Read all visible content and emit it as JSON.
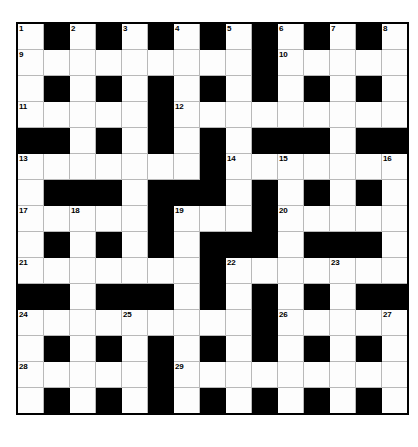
{
  "puzzle": {
    "type": "crossword-grid",
    "title": "",
    "rows": 15,
    "columns": 15,
    "cell_size_px": 25,
    "colors": {
      "block": "#000000",
      "cell": "#fdfdfd",
      "grid_line": "#b9b9b9",
      "border": "#000000",
      "number_text": "#000000",
      "page_background": "#ffffff"
    },
    "numbers_present": [
      1,
      2,
      3,
      4,
      5,
      6,
      7,
      8,
      9,
      10,
      11,
      12,
      13,
      14,
      15,
      16,
      17,
      18,
      19,
      20,
      21,
      22,
      23,
      24,
      25,
      26,
      27,
      28,
      29
    ],
    "grid": [
      [
        {
          "block": false,
          "number": "1"
        },
        {
          "block": true,
          "number": ""
        },
        {
          "block": false,
          "number": "2"
        },
        {
          "block": true,
          "number": ""
        },
        {
          "block": false,
          "number": "3"
        },
        {
          "block": true,
          "number": ""
        },
        {
          "block": false,
          "number": "4"
        },
        {
          "block": true,
          "number": ""
        },
        {
          "block": false,
          "number": "5"
        },
        {
          "block": true,
          "number": ""
        },
        {
          "block": false,
          "number": "6"
        },
        {
          "block": true,
          "number": ""
        },
        {
          "block": false,
          "number": "7"
        },
        {
          "block": true,
          "number": ""
        },
        {
          "block": false,
          "number": "8"
        }
      ],
      [
        {
          "block": false,
          "number": "9"
        },
        {
          "block": false,
          "number": ""
        },
        {
          "block": false,
          "number": ""
        },
        {
          "block": false,
          "number": ""
        },
        {
          "block": false,
          "number": ""
        },
        {
          "block": false,
          "number": ""
        },
        {
          "block": false,
          "number": ""
        },
        {
          "block": false,
          "number": ""
        },
        {
          "block": false,
          "number": ""
        },
        {
          "block": true,
          "number": ""
        },
        {
          "block": false,
          "number": "10"
        },
        {
          "block": false,
          "number": ""
        },
        {
          "block": false,
          "number": ""
        },
        {
          "block": false,
          "number": ""
        },
        {
          "block": false,
          "number": ""
        }
      ],
      [
        {
          "block": false,
          "number": ""
        },
        {
          "block": true,
          "number": ""
        },
        {
          "block": false,
          "number": ""
        },
        {
          "block": true,
          "number": ""
        },
        {
          "block": false,
          "number": ""
        },
        {
          "block": true,
          "number": ""
        },
        {
          "block": false,
          "number": ""
        },
        {
          "block": true,
          "number": ""
        },
        {
          "block": false,
          "number": ""
        },
        {
          "block": true,
          "number": ""
        },
        {
          "block": false,
          "number": ""
        },
        {
          "block": true,
          "number": ""
        },
        {
          "block": false,
          "number": ""
        },
        {
          "block": true,
          "number": ""
        },
        {
          "block": false,
          "number": ""
        }
      ],
      [
        {
          "block": false,
          "number": "11"
        },
        {
          "block": false,
          "number": ""
        },
        {
          "block": false,
          "number": ""
        },
        {
          "block": false,
          "number": ""
        },
        {
          "block": false,
          "number": ""
        },
        {
          "block": true,
          "number": ""
        },
        {
          "block": false,
          "number": "12"
        },
        {
          "block": false,
          "number": ""
        },
        {
          "block": false,
          "number": ""
        },
        {
          "block": false,
          "number": ""
        },
        {
          "block": false,
          "number": ""
        },
        {
          "block": false,
          "number": ""
        },
        {
          "block": false,
          "number": ""
        },
        {
          "block": false,
          "number": ""
        },
        {
          "block": false,
          "number": ""
        }
      ],
      [
        {
          "block": true,
          "number": ""
        },
        {
          "block": true,
          "number": ""
        },
        {
          "block": false,
          "number": ""
        },
        {
          "block": true,
          "number": ""
        },
        {
          "block": false,
          "number": ""
        },
        {
          "block": true,
          "number": ""
        },
        {
          "block": false,
          "number": ""
        },
        {
          "block": true,
          "number": ""
        },
        {
          "block": false,
          "number": ""
        },
        {
          "block": true,
          "number": ""
        },
        {
          "block": true,
          "number": ""
        },
        {
          "block": true,
          "number": ""
        },
        {
          "block": false,
          "number": ""
        },
        {
          "block": true,
          "number": ""
        },
        {
          "block": true,
          "number": ""
        }
      ],
      [
        {
          "block": false,
          "number": "13"
        },
        {
          "block": false,
          "number": ""
        },
        {
          "block": false,
          "number": ""
        },
        {
          "block": false,
          "number": ""
        },
        {
          "block": false,
          "number": ""
        },
        {
          "block": false,
          "number": ""
        },
        {
          "block": false,
          "number": ""
        },
        {
          "block": true,
          "number": ""
        },
        {
          "block": false,
          "number": "14"
        },
        {
          "block": false,
          "number": ""
        },
        {
          "block": false,
          "number": "15"
        },
        {
          "block": false,
          "number": ""
        },
        {
          "block": false,
          "number": ""
        },
        {
          "block": false,
          "number": ""
        },
        {
          "block": false,
          "number": "16"
        }
      ],
      [
        {
          "block": false,
          "number": ""
        },
        {
          "block": true,
          "number": ""
        },
        {
          "block": true,
          "number": ""
        },
        {
          "block": true,
          "number": ""
        },
        {
          "block": false,
          "number": ""
        },
        {
          "block": true,
          "number": ""
        },
        {
          "block": true,
          "number": ""
        },
        {
          "block": true,
          "number": ""
        },
        {
          "block": false,
          "number": ""
        },
        {
          "block": true,
          "number": ""
        },
        {
          "block": false,
          "number": ""
        },
        {
          "block": true,
          "number": ""
        },
        {
          "block": false,
          "number": ""
        },
        {
          "block": true,
          "number": ""
        },
        {
          "block": false,
          "number": ""
        }
      ],
      [
        {
          "block": false,
          "number": "17"
        },
        {
          "block": false,
          "number": ""
        },
        {
          "block": false,
          "number": "18"
        },
        {
          "block": false,
          "number": ""
        },
        {
          "block": false,
          "number": ""
        },
        {
          "block": true,
          "number": ""
        },
        {
          "block": false,
          "number": "19"
        },
        {
          "block": false,
          "number": ""
        },
        {
          "block": false,
          "number": ""
        },
        {
          "block": true,
          "number": ""
        },
        {
          "block": false,
          "number": "20"
        },
        {
          "block": false,
          "number": ""
        },
        {
          "block": false,
          "number": ""
        },
        {
          "block": false,
          "number": ""
        },
        {
          "block": false,
          "number": ""
        }
      ],
      [
        {
          "block": false,
          "number": ""
        },
        {
          "block": true,
          "number": ""
        },
        {
          "block": false,
          "number": ""
        },
        {
          "block": true,
          "number": ""
        },
        {
          "block": false,
          "number": ""
        },
        {
          "block": true,
          "number": ""
        },
        {
          "block": false,
          "number": ""
        },
        {
          "block": true,
          "number": ""
        },
        {
          "block": true,
          "number": ""
        },
        {
          "block": true,
          "number": ""
        },
        {
          "block": false,
          "number": ""
        },
        {
          "block": true,
          "number": ""
        },
        {
          "block": true,
          "number": ""
        },
        {
          "block": true,
          "number": ""
        },
        {
          "block": false,
          "number": ""
        }
      ],
      [
        {
          "block": false,
          "number": "21"
        },
        {
          "block": false,
          "number": ""
        },
        {
          "block": false,
          "number": ""
        },
        {
          "block": false,
          "number": ""
        },
        {
          "block": false,
          "number": ""
        },
        {
          "block": false,
          "number": ""
        },
        {
          "block": false,
          "number": ""
        },
        {
          "block": true,
          "number": ""
        },
        {
          "block": false,
          "number": "22"
        },
        {
          "block": false,
          "number": ""
        },
        {
          "block": false,
          "number": ""
        },
        {
          "block": false,
          "number": ""
        },
        {
          "block": false,
          "number": "23"
        },
        {
          "block": false,
          "number": ""
        },
        {
          "block": false,
          "number": ""
        }
      ],
      [
        {
          "block": true,
          "number": ""
        },
        {
          "block": true,
          "number": ""
        },
        {
          "block": false,
          "number": ""
        },
        {
          "block": true,
          "number": ""
        },
        {
          "block": true,
          "number": ""
        },
        {
          "block": true,
          "number": ""
        },
        {
          "block": false,
          "number": ""
        },
        {
          "block": true,
          "number": ""
        },
        {
          "block": false,
          "number": ""
        },
        {
          "block": true,
          "number": ""
        },
        {
          "block": false,
          "number": ""
        },
        {
          "block": true,
          "number": ""
        },
        {
          "block": false,
          "number": ""
        },
        {
          "block": true,
          "number": ""
        },
        {
          "block": true,
          "number": ""
        }
      ],
      [
        {
          "block": false,
          "number": "24"
        },
        {
          "block": false,
          "number": ""
        },
        {
          "block": false,
          "number": ""
        },
        {
          "block": false,
          "number": ""
        },
        {
          "block": false,
          "number": "25"
        },
        {
          "block": false,
          "number": ""
        },
        {
          "block": false,
          "number": ""
        },
        {
          "block": false,
          "number": ""
        },
        {
          "block": false,
          "number": ""
        },
        {
          "block": true,
          "number": ""
        },
        {
          "block": false,
          "number": "26"
        },
        {
          "block": false,
          "number": ""
        },
        {
          "block": false,
          "number": ""
        },
        {
          "block": false,
          "number": ""
        },
        {
          "block": false,
          "number": "27"
        }
      ],
      [
        {
          "block": false,
          "number": ""
        },
        {
          "block": true,
          "number": ""
        },
        {
          "block": false,
          "number": ""
        },
        {
          "block": true,
          "number": ""
        },
        {
          "block": false,
          "number": ""
        },
        {
          "block": true,
          "number": ""
        },
        {
          "block": false,
          "number": ""
        },
        {
          "block": true,
          "number": ""
        },
        {
          "block": false,
          "number": ""
        },
        {
          "block": true,
          "number": ""
        },
        {
          "block": false,
          "number": ""
        },
        {
          "block": true,
          "number": ""
        },
        {
          "block": false,
          "number": ""
        },
        {
          "block": true,
          "number": ""
        },
        {
          "block": false,
          "number": ""
        }
      ],
      [
        {
          "block": false,
          "number": "28"
        },
        {
          "block": false,
          "number": ""
        },
        {
          "block": false,
          "number": ""
        },
        {
          "block": false,
          "number": ""
        },
        {
          "block": false,
          "number": ""
        },
        {
          "block": true,
          "number": ""
        },
        {
          "block": false,
          "number": "29"
        },
        {
          "block": false,
          "number": ""
        },
        {
          "block": false,
          "number": ""
        },
        {
          "block": false,
          "number": ""
        },
        {
          "block": false,
          "number": ""
        },
        {
          "block": false,
          "number": ""
        },
        {
          "block": false,
          "number": ""
        },
        {
          "block": false,
          "number": ""
        },
        {
          "block": false,
          "number": ""
        }
      ],
      [
        {
          "block": false,
          "number": ""
        },
        {
          "block": true,
          "number": ""
        },
        {
          "block": false,
          "number": ""
        },
        {
          "block": true,
          "number": ""
        },
        {
          "block": false,
          "number": ""
        },
        {
          "block": true,
          "number": ""
        },
        {
          "block": false,
          "number": ""
        },
        {
          "block": true,
          "number": ""
        },
        {
          "block": false,
          "number": ""
        },
        {
          "block": true,
          "number": ""
        },
        {
          "block": false,
          "number": ""
        },
        {
          "block": true,
          "number": ""
        },
        {
          "block": false,
          "number": ""
        },
        {
          "block": true,
          "number": ""
        },
        {
          "block": false,
          "number": ""
        }
      ]
    ]
  }
}
